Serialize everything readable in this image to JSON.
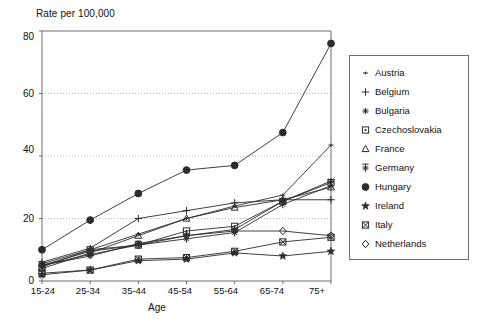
{
  "chart_data": {
    "type": "line",
    "title": "Rate per 100,000",
    "subtitle": "",
    "xlabel": "Age",
    "ylabel": "Rate per 100,000",
    "categories": [
      "15-24",
      "25-34",
      "35-44",
      "45-54",
      "55-64",
      "65-74",
      "75+"
    ],
    "ylim": [
      0,
      80
    ],
    "yticks": [
      0,
      20,
      40,
      60,
      80
    ],
    "grid": "horizontal-dotted",
    "legend_position": "right-outside",
    "series": [
      {
        "name": "Austria",
        "marker": "small-cross",
        "values": [
          5.5,
          10.0,
          15.0,
          20.0,
          24.0,
          27.5,
          43.5
        ]
      },
      {
        "name": "Belgium",
        "marker": "plus",
        "values": [
          6.0,
          10.5,
          20.0,
          22.5,
          25.0,
          26.0,
          26.0
        ]
      },
      {
        "name": "Bulgaria",
        "marker": "asterisk",
        "values": [
          5.0,
          8.0,
          12.0,
          14.5,
          16.5,
          25.5,
          32.0
        ]
      },
      {
        "name": "Czechoslovakia",
        "marker": "square-dot",
        "values": [
          4.5,
          10.0,
          11.5,
          16.0,
          17.5,
          25.5,
          31.5
        ]
      },
      {
        "name": "France",
        "marker": "open-triangle",
        "values": [
          4.0,
          9.0,
          14.5,
          20.0,
          23.5,
          26.0,
          30.0
        ]
      },
      {
        "name": "Germany",
        "marker": "asterisk-bar",
        "values": [
          5.0,
          8.5,
          11.5,
          13.5,
          15.5,
          24.5,
          30.5
        ]
      },
      {
        "name": "Hungary",
        "marker": "filled-circle",
        "values": [
          10.0,
          19.5,
          28.0,
          35.5,
          37.0,
          47.5,
          76.0
        ]
      },
      {
        "name": "Ireland",
        "marker": "filled-star",
        "values": [
          2.0,
          3.5,
          6.5,
          7.0,
          9.0,
          8.0,
          9.5
        ]
      },
      {
        "name": "Italy",
        "marker": "square-x",
        "values": [
          2.5,
          3.5,
          7.0,
          7.5,
          9.5,
          12.5,
          14.0
        ]
      },
      {
        "name": "Netherlands",
        "marker": "open-diamond",
        "values": [
          5.0,
          9.5,
          11.5,
          14.5,
          16.0,
          16.0,
          14.5
        ]
      }
    ]
  },
  "chart": {
    "title": "Rate per 100,000",
    "xlabel": "Age",
    "ytick_labels": [
      "80",
      "60",
      "40",
      "20",
      "0"
    ],
    "xtick_labels": [
      "15-24",
      "25-34",
      "35-44",
      "45-54",
      "55-64",
      "65-74",
      "75+"
    ]
  },
  "legend": {
    "items": [
      {
        "label": "Austria"
      },
      {
        "label": "Belgium"
      },
      {
        "label": "Bulgaria"
      },
      {
        "label": "Czechoslovakia"
      },
      {
        "label": "France"
      },
      {
        "label": "Germany"
      },
      {
        "label": "Hungary"
      },
      {
        "label": "Ireland"
      },
      {
        "label": "Italy"
      },
      {
        "label": "Netherlands"
      }
    ]
  },
  "colors": {
    "line": "#2b2b2b",
    "axis": "#6d6d6d",
    "grid": "#b9b9b9",
    "background": "#ffffff"
  }
}
